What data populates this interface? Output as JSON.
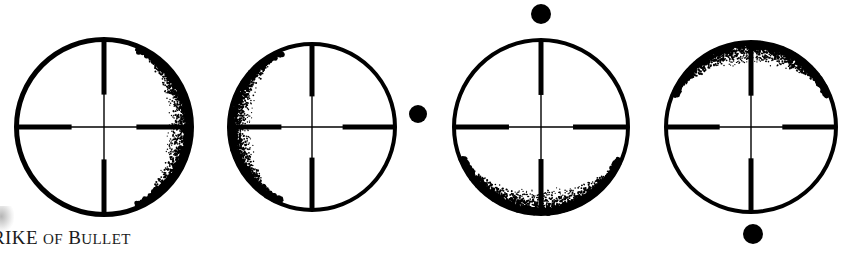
{
  "figure": {
    "caption_text": "RIKE OF BULLET",
    "caption_first_letters": "RIKE",
    "caption_word2": "OF",
    "caption_word3": "BULLET",
    "ink_color": "#000000",
    "background_color": "#ffffff"
  },
  "scopes": [
    {
      "id": "scope-1",
      "label": "reticle-shading-right",
      "center_x": 104,
      "center_y": 127,
      "radius": 90,
      "ring_width": 5,
      "shade_side": "right",
      "shade_start_deg": -68,
      "shade_end_deg": 68,
      "dot": null
    },
    {
      "id": "scope-2",
      "label": "reticle-shading-left",
      "center_x": 312,
      "center_y": 127,
      "radius": 85,
      "ring_width": 4,
      "shade_side": "left",
      "shade_start_deg": 112,
      "shade_end_deg": 248,
      "dot": {
        "x": 418,
        "y": 114,
        "r": 9,
        "position": "right-of-scope"
      }
    },
    {
      "id": "scope-3",
      "label": "reticle-shading-bottom",
      "center_x": 541,
      "center_y": 127,
      "radius": 89,
      "ring_width": 4,
      "shade_side": "bottom",
      "shade_start_deg": 22,
      "shade_end_deg": 158,
      "dot": {
        "x": 541,
        "y": 14,
        "r": 10,
        "position": "above-scope"
      }
    },
    {
      "id": "scope-4",
      "label": "reticle-shading-top",
      "center_x": 751,
      "center_y": 127,
      "radius": 87,
      "ring_width": 4,
      "shade_side": "top",
      "shade_start_deg": 202,
      "shade_end_deg": 338,
      "dot": {
        "x": 753,
        "y": 234,
        "r": 10,
        "position": "below-scope"
      }
    }
  ],
  "reticle": {
    "type": "duplex-crosshair",
    "thick_line_width": 5,
    "thin_line_width": 1.4,
    "thin_fraction": 0.36
  }
}
